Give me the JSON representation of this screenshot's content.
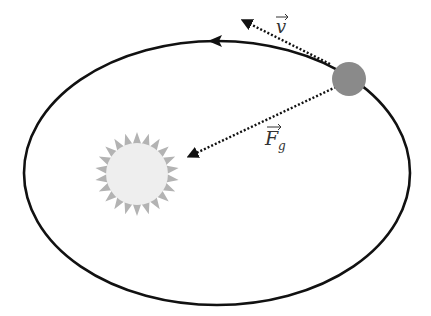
{
  "diagram": {
    "labels": {
      "velocity": "v",
      "force": "F",
      "force_subscript": "g"
    },
    "colors": {
      "orbit": "#111111",
      "planet": "#8a8a8a",
      "sun_core": "#eeeeee",
      "sun_rays": "#b0b0b0",
      "arrow": "#111111"
    },
    "elements": [
      "elliptical-orbit",
      "orbit-direction-arrow",
      "sun",
      "planet",
      "velocity-vector",
      "gravity-force-vector"
    ]
  }
}
